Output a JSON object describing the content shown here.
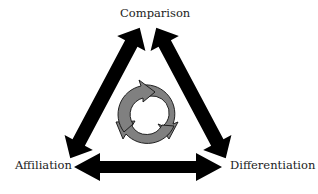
{
  "diagram": {
    "nodes": {
      "top": "Comparison",
      "left": "Affiliation",
      "right": "Differentiation"
    },
    "edges": [
      {
        "from": "Comparison",
        "to": "Affiliation",
        "type": "double-arrow"
      },
      {
        "from": "Comparison",
        "to": "Differentiation",
        "type": "double-arrow"
      },
      {
        "from": "Affiliation",
        "to": "Differentiation",
        "type": "double-arrow"
      }
    ],
    "center": {
      "icon": "cycle-icon",
      "arrows": 3
    },
    "colors": {
      "arrow": "#000000",
      "cycle_fill": "#808080",
      "cycle_stroke": "#111111"
    }
  }
}
